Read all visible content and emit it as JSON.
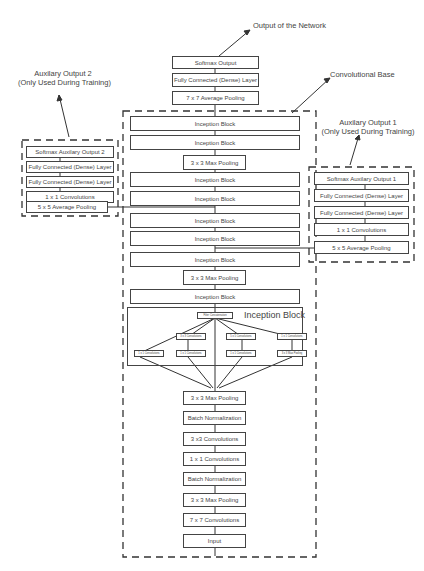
{
  "labels": {
    "output_network": "Output of the Network",
    "convolutional_base": "Convolutional Base",
    "aux2_title": "Auxilary Output 2",
    "aux2_sub": "(Only Used  During Training)",
    "aux1_title": "Auxilary Output 1",
    "aux1_sub": "(Only Used  During Training)",
    "inception_block_title": "Inception Block"
  },
  "main_column": {
    "head": [
      "Softmax Output",
      "Fully Connected (Dense) Layer",
      "7 x 7 Average Pooling"
    ],
    "body": [
      "Inception Block",
      "Inception Block",
      "3 x 3 Max Pooling",
      "Inception Block",
      "Inception Block",
      "Inception Block",
      "Inception Block",
      "Inception Block",
      "3 x 3 Max Pooling",
      "Inception Block",
      "3 x 3 Max Pooling",
      "Batch Normalization",
      "3 x3 Convolutions",
      "1 x 1 Convolutions",
      "Batch Normalization",
      "3 x 3 Max Pooling",
      "7 x 7 Convolutions",
      "Input"
    ]
  },
  "aux2": [
    "Softmax Auxilary Output 2",
    "Fully Connected (Dense) Layer",
    "Fully Connected (Dense) Layer",
    "1 x 1 Convolutions",
    "5 x 5 Average Pooling"
  ],
  "aux1": [
    "Softmax Auxilary Output 1",
    "Fully Connected (Dense) Layer",
    "Fully Connected (Dense) Layer",
    "1 x 1 Convolutions",
    "5 x 5 Average Pooling"
  ],
  "inception_detail": {
    "concat": "Filter Concatenation",
    "top_row": [
      "3 x 3 Convolutions",
      "5 x 5 Convolutions",
      "1 x 1 Convolutions"
    ],
    "bottom_row": [
      "1 x 1 Convolutions",
      "1 x 1 Convolutions",
      "1 x 1 Convolutions",
      "3 x 3 Max Pooling"
    ]
  }
}
